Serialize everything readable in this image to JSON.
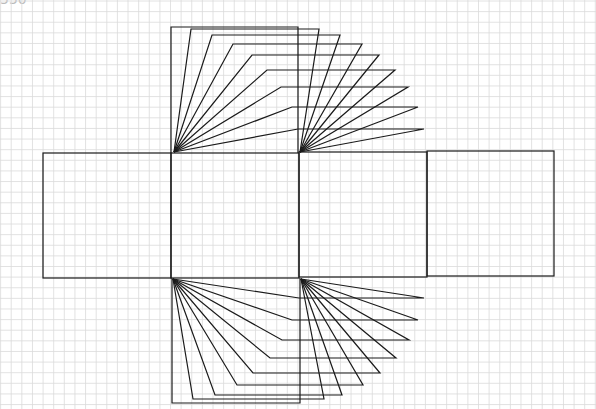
{
  "corner_label": "550",
  "grid": {
    "spacing": 10.62,
    "offset_x": 0.6,
    "offset_y": 1.0,
    "color": "#dadada"
  },
  "stroke": {
    "color": "#1a1a1a",
    "width": 1.2
  },
  "squares": [
    {
      "name": "left-face",
      "x": 43,
      "y": 153,
      "w": 128,
      "h": 125
    },
    {
      "name": "center-face",
      "x": 171,
      "y": 153,
      "w": 128,
      "h": 125
    },
    {
      "name": "right-face",
      "x": 299,
      "y": 152,
      "w": 128,
      "h": 125
    },
    {
      "name": "far-right-face",
      "x": 427,
      "y": 151,
      "w": 127,
      "h": 125
    }
  ],
  "outer_frames": [
    {
      "name": "top-frame",
      "points": [
        [
          171,
          153
        ],
        [
          171,
          27
        ],
        [
          298,
          27
        ],
        [
          298,
          153
        ]
      ]
    },
    {
      "name": "bottom-frame",
      "points": [
        [
          172,
          278
        ],
        [
          172,
          403
        ],
        [
          300,
          403
        ],
        [
          300,
          278
        ]
      ]
    }
  ],
  "top_fan_lines": [
    [
      [
        174,
        152
      ],
      [
        191,
        29
      ],
      [
        319,
        29
      ],
      [
        300,
        152
      ]
    ],
    [
      [
        174,
        152
      ],
      [
        212,
        35
      ],
      [
        340,
        35
      ],
      [
        300,
        152
      ]
    ],
    [
      [
        174,
        152
      ],
      [
        233,
        44
      ],
      [
        362,
        44
      ],
      [
        300,
        152
      ]
    ],
    [
      [
        174,
        152
      ],
      [
        252,
        55
      ],
      [
        379,
        55
      ],
      [
        300,
        152
      ]
    ],
    [
      [
        174,
        152
      ],
      [
        267,
        70
      ],
      [
        395,
        70
      ],
      [
        300,
        152
      ]
    ],
    [
      [
        174,
        152
      ],
      [
        281,
        87
      ],
      [
        408,
        87
      ],
      [
        300,
        152
      ]
    ],
    [
      [
        174,
        152
      ],
      [
        292,
        107
      ],
      [
        418,
        107
      ],
      [
        300,
        152
      ]
    ],
    [
      [
        174,
        152
      ],
      [
        298,
        129
      ],
      [
        424,
        129
      ],
      [
        300,
        152
      ]
    ]
  ],
  "bottom_fan_lines": [
    [
      [
        173,
        279
      ],
      [
        299,
        298
      ],
      [
        424,
        298
      ],
      [
        301,
        279
      ]
    ],
    [
      [
        173,
        279
      ],
      [
        292,
        320
      ],
      [
        418,
        320
      ],
      [
        301,
        279
      ]
    ],
    [
      [
        173,
        279
      ],
      [
        282,
        340
      ],
      [
        409,
        340
      ],
      [
        301,
        279
      ]
    ],
    [
      [
        173,
        279
      ],
      [
        270,
        358
      ],
      [
        396,
        358
      ],
      [
        301,
        279
      ]
    ],
    [
      [
        173,
        279
      ],
      [
        253,
        373
      ],
      [
        380,
        373
      ],
      [
        301,
        279
      ]
    ],
    [
      [
        173,
        279
      ],
      [
        237,
        385
      ],
      [
        363,
        385
      ],
      [
        301,
        279
      ]
    ],
    [
      [
        173,
        279
      ],
      [
        215,
        395
      ],
      [
        342,
        395
      ],
      [
        301,
        279
      ]
    ],
    [
      [
        173,
        279
      ],
      [
        193,
        399
      ],
      [
        324,
        399
      ],
      [
        301,
        279
      ]
    ]
  ]
}
